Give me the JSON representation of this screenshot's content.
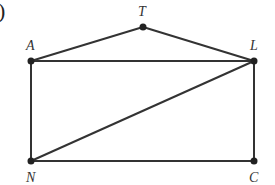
{
  "diagram": {
    "fragment_label": ")",
    "points": [
      {
        "id": "A",
        "label": "A",
        "x": 31,
        "y": 61,
        "lx": 26,
        "ly": 50
      },
      {
        "id": "T",
        "label": "T",
        "x": 143,
        "y": 27,
        "lx": 138,
        "ly": 16
      },
      {
        "id": "L",
        "label": "L",
        "x": 254,
        "y": 61,
        "lx": 250,
        "ly": 50
      },
      {
        "id": "N",
        "label": "N",
        "x": 31,
        "y": 161,
        "lx": 26,
        "ly": 182
      },
      {
        "id": "C",
        "label": "C",
        "x": 254,
        "y": 161,
        "lx": 249,
        "ly": 182
      }
    ],
    "segments": [
      [
        "A",
        "T"
      ],
      [
        "T",
        "L"
      ],
      [
        "A",
        "L"
      ],
      [
        "A",
        "N"
      ],
      [
        "L",
        "C"
      ],
      [
        "N",
        "C"
      ],
      [
        "N",
        "L"
      ]
    ],
    "colors": {
      "line": "#333333",
      "point": "#222222"
    }
  }
}
